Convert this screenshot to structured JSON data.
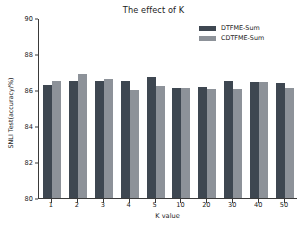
{
  "chart_data": {
    "type": "bar",
    "title": "The effect of K",
    "xlabel": "K value",
    "ylabel": "SNLI Test(accuracy/%)",
    "categories": [
      "1",
      "2",
      "3",
      "4",
      "5",
      "10",
      "20",
      "30",
      "40",
      "50"
    ],
    "series": [
      {
        "name": "DTFME-Sum",
        "color": "#3e4751",
        "values": [
          86.3,
          86.52,
          86.52,
          86.5,
          86.72,
          86.12,
          86.15,
          86.5,
          86.43,
          86.4
        ]
      },
      {
        "name": "CDTFME-Sum",
        "color": "#8d9299",
        "values": [
          86.52,
          86.9,
          86.6,
          86.02,
          86.2,
          86.12,
          86.03,
          86.06,
          86.43,
          86.1
        ]
      }
    ],
    "ylim": [
      80,
      90
    ],
    "yticks": [
      80,
      82,
      84,
      86,
      88,
      90
    ],
    "ytick_labels": [
      "80",
      "82",
      "84",
      "86",
      "88",
      "90"
    ],
    "grid": false,
    "legend_position": "upper right"
  },
  "legend": {
    "entries": [
      {
        "label": "DTFME-Sum",
        "swatch": "dark"
      },
      {
        "label": "CDTFME-Sum",
        "swatch": "light"
      }
    ]
  }
}
